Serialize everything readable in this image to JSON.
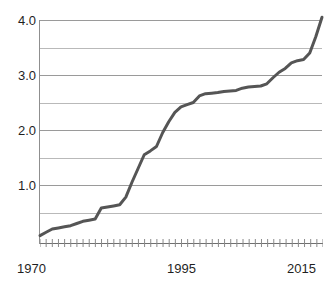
{
  "chart_data": {
    "type": "line",
    "title": "",
    "subtitle": "",
    "xlabel": "",
    "ylabel": "",
    "xlim": [
      1970,
      2016
    ],
    "ylim": [
      0,
      4.2
    ],
    "grid": true,
    "legend": null,
    "y_ticks_labeled": [
      "1.0",
      "2.0",
      "3.0",
      "4.0"
    ],
    "y_gridlines": [
      0.5,
      1.0,
      1.5,
      2.0,
      2.5,
      3.0,
      3.5,
      4.0
    ],
    "x_ticks_labeled": [
      "1970",
      "1995",
      "2015"
    ],
    "x_minor_tick_count": 47,
    "line_color": "#555555",
    "grid_color": "#9a9a9a",
    "axis_color": "#6f6f6f",
    "text_color": "#1f1f1f",
    "background_color": "#ffffff",
    "series": [
      {
        "name": "series-1",
        "x": [
          1970,
          1971,
          1972,
          1973,
          1974,
          1975,
          1976,
          1977,
          1978,
          1979,
          1980,
          1981,
          1982,
          1983,
          1984,
          1985,
          1986,
          1987,
          1988,
          1989,
          1990,
          1991,
          1992,
          1993,
          1994,
          1995,
          1996,
          1997,
          1998,
          1999,
          2000,
          2001,
          2002,
          2003,
          2004,
          2005,
          2006,
          2007,
          2008,
          2009,
          2010,
          2011,
          2012,
          2013,
          2014,
          2015,
          2016
        ],
        "values": [
          0.08,
          0.14,
          0.2,
          0.22,
          0.24,
          0.26,
          0.3,
          0.34,
          0.36,
          0.38,
          0.58,
          0.6,
          0.62,
          0.64,
          0.78,
          1.05,
          1.3,
          1.55,
          1.62,
          1.7,
          1.95,
          2.15,
          2.32,
          2.42,
          2.46,
          2.5,
          2.62,
          2.66,
          2.67,
          2.68,
          2.7,
          2.71,
          2.72,
          2.76,
          2.78,
          2.79,
          2.8,
          2.84,
          2.95,
          3.05,
          3.12,
          3.22,
          3.26,
          3.28,
          3.4,
          3.7,
          4.05
        ]
      }
    ]
  },
  "axis": {
    "y_labels": [
      {
        "text": "4.0",
        "value": 4.0
      },
      {
        "text": "3.0",
        "value": 3.0
      },
      {
        "text": "2.0",
        "value": 2.0
      },
      {
        "text": "1.0",
        "value": 1.0
      }
    ],
    "x_labels": [
      {
        "text": "1970",
        "value": 1970
      },
      {
        "text": "1995",
        "value": 1995
      },
      {
        "text": "2015",
        "value": 2015
      }
    ]
  }
}
